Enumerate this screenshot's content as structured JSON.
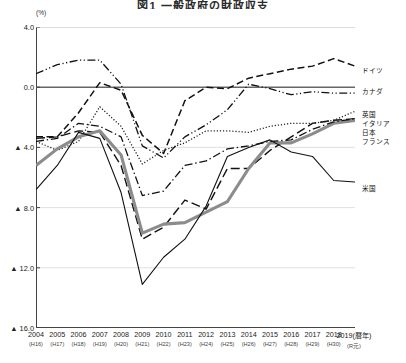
{
  "title": "図1 一般政府の財政収支",
  "axis": {
    "y_unit": "(%)",
    "y_ticks": [
      "4.0",
      "0.0",
      "▲ 4.0",
      "▲ 8.0",
      "▲ 12.0",
      "▲ 16.0"
    ],
    "y_values": [
      4.0,
      0.0,
      -4.0,
      -8.0,
      -12.0,
      -16.0
    ],
    "x_note": "(暦年)"
  },
  "legend": {
    "germany": "ドイツ",
    "canada": "カナダ",
    "uk": "英国",
    "italy": "イタリア",
    "japan": "日本",
    "france": "フランス",
    "usa": "米国"
  },
  "chart_data": {
    "type": "line",
    "title": "図1 一般政府の財政収支",
    "xlabel": "(暦年)",
    "ylabel": "(%)",
    "ylim": [
      -16.0,
      4.0
    ],
    "grid": true,
    "legend_position": "right",
    "categories": [
      "2004",
      "2005",
      "2006",
      "2007",
      "2008",
      "2009",
      "2010",
      "2011",
      "2012",
      "2013",
      "2014",
      "2015",
      "2016",
      "2017",
      "2018",
      "2019"
    ],
    "eras": [
      "(H16)",
      "(H17)",
      "(H18)",
      "(H19)",
      "(H20)",
      "(H21)",
      "(H22)",
      "(H23)",
      "(H24)",
      "(H25)",
      "(H26)",
      "(H27)",
      "(H28)",
      "(H29)",
      "(H30)",
      "(R元)"
    ],
    "series": [
      {
        "name": "ドイツ",
        "style": "dashed",
        "color": "#111111",
        "values": [
          -3.3,
          -3.3,
          -1.7,
          0.3,
          -0.2,
          -3.2,
          -4.4,
          -0.9,
          0.0,
          -0.1,
          0.6,
          0.9,
          1.2,
          1.4,
          1.9,
          1.4
        ]
      },
      {
        "name": "カナダ",
        "style": "dash-dot-dot",
        "color": "#111111",
        "values": [
          0.9,
          1.5,
          1.8,
          1.8,
          0.2,
          -3.9,
          -4.7,
          -3.3,
          -2.5,
          -1.5,
          0.2,
          -0.1,
          -0.5,
          -0.3,
          -0.4,
          -0.4
        ]
      },
      {
        "name": "英国",
        "style": "long-dash",
        "color": "#111111",
        "values": [
          -3.4,
          -3.3,
          -2.9,
          -3.0,
          -5.2,
          -10.1,
          -9.3,
          -7.5,
          -8.1,
          -5.4,
          -5.4,
          -4.2,
          -3.3,
          -2.4,
          -2.2,
          -2.1
        ]
      },
      {
        "name": "イタリア",
        "style": "dotted",
        "color": "#222222",
        "values": [
          -3.6,
          -4.2,
          -3.6,
          -1.3,
          -2.6,
          -5.1,
          -4.2,
          -3.7,
          -2.9,
          -2.9,
          -3.0,
          -2.6,
          -2.4,
          -2.4,
          -2.2,
          -1.6
        ]
      },
      {
        "name": "日本",
        "style": "thick-solid",
        "color": "#8c8c8c",
        "values": [
          -5.2,
          -4.1,
          -3.3,
          -2.9,
          -4.5,
          -9.7,
          -9.1,
          -9.0,
          -8.3,
          -7.6,
          -5.4,
          -3.7,
          -3.7,
          -3.1,
          -2.4,
          -2.2
        ]
      },
      {
        "name": "フランス",
        "style": "dash-dot",
        "color": "#111111",
        "values": [
          -3.6,
          -3.4,
          -2.4,
          -2.6,
          -3.3,
          -7.2,
          -6.9,
          -5.2,
          -4.9,
          -4.1,
          -3.9,
          -3.6,
          -3.5,
          -2.8,
          -2.3,
          -2.1
        ]
      },
      {
        "name": "米国",
        "style": "thin-solid",
        "color": "#111111",
        "values": [
          -6.8,
          -5.2,
          -3.0,
          -3.4,
          -7.0,
          -13.1,
          -11.3,
          -10.1,
          -7.9,
          -4.6,
          -4.0,
          -3.5,
          -4.3,
          -4.6,
          -6.2,
          -6.3
        ]
      }
    ]
  }
}
